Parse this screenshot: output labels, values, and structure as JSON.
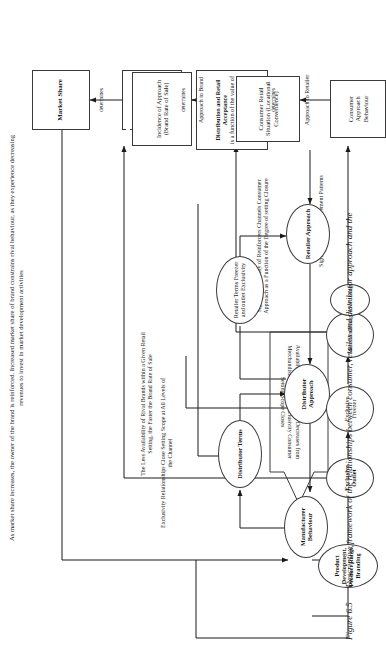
{
  "figure": {
    "caption_number": "Figure 6.5",
    "caption_text": "Descriptive framework of the relationships between consumer, retailer and distributor approach and the"
  },
  "annotations": {
    "market_share_note": "As market share increases, the owner of the brand is reinforced. Increased market share of brand constrains rival behaviour, as they experience decreasing revenues to invest in market development activities",
    "exclusivity_note": "Exclusivity Relationships Close Setting Scope at All Levels of the Channel",
    "rival_brands_note": "The Less Availability of Rival Brands within a Given Retail Setting, the Faster the Brand Rate of Sale",
    "reinforcers_note": "Signals Availability of Reinforcers Channels Consumer Approach as a Function of the Degree of setting Closure",
    "brand_reinforcement_note": "Signals Brand Reinforcement Patterns",
    "availability_arrow_note": "Availability of Multiple Brands Decreases from Merchandising to Outlet Exclusivity Consumer Setting Scope Closes"
  },
  "nodes": {
    "manufacturer_behaviour": "Manufacturer Behaviour",
    "distributor_terms": "Distributor Terms",
    "distributor_approach": "Distributor Approach",
    "retailer_terms": "Retailer Terms Freezer and outlet Exclusivity",
    "retailer_approach": "Retailer Approach",
    "product_development": "Product Development, Product Range, Branding",
    "exclusive_outlet": "Exclusive Outlet",
    "exclusive_freezer": "Exclusive Freezer",
    "merchandising": "Merchandising",
    "advertising": "Advertising",
    "market_share": "Market Share",
    "retail_penetration_title": "Retail Penetration",
    "retail_penetration_sub": "(the strength and incidence of retail approach)",
    "distribution_retail_acceptance_title": "Distribution and Retail Acceptance",
    "distribution_retail_acceptance_sub": "is a function of the value of the brand as a business reinforcer",
    "incidence_of_approach_title": "Incidence of Approach",
    "incidence_of_approach_sub": "(Brand Rate of Sale)",
    "consumer_retail_situation": "Consumer Retail Situation (Locational Convenience)",
    "consumer_approach_behaviour": "Consumer Approach Behaviour"
  },
  "edge_labels": {
    "determines_1": "determines",
    "determines_2": "determines",
    "determines_3": "determines",
    "approach_to_brand": "Approach to Brand",
    "approach_to_retailer": "Approach to Retailer"
  },
  "colors": {
    "stroke": "#3a3a3a",
    "text": "#1a1a1a",
    "background": "#ffffff"
  }
}
